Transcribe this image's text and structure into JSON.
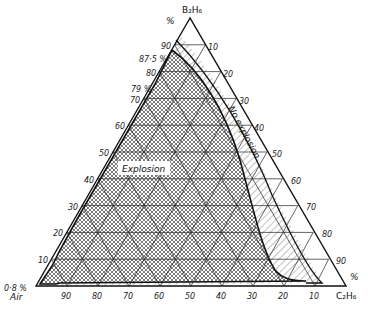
{
  "diagram": {
    "type": "ternary",
    "vertices": {
      "top": "B₂H₆",
      "bottom_left": "Air",
      "bottom_right": "C₂H₆"
    },
    "percent_unit": "%",
    "left_axis_ticks": [
      "10",
      "20",
      "30",
      "40",
      "50",
      "60",
      "70",
      "80",
      "90"
    ],
    "right_axis_ticks": [
      "10",
      "20",
      "30",
      "40",
      "50",
      "60",
      "70",
      "80",
      "90"
    ],
    "bottom_axis_ticks": [
      "90",
      "80",
      "70",
      "60",
      "50",
      "40",
      "30",
      "20",
      "10"
    ],
    "annotations": {
      "limit_87_5": "87·5 %",
      "limit_79": "79 %",
      "limit_0_8": "0·8 %"
    },
    "regions": {
      "explosion": "Explosion",
      "no_explosion": "No explosion"
    },
    "colors": {
      "line": "#111111",
      "hatch": "#555555",
      "background": "#ffffff"
    }
  }
}
